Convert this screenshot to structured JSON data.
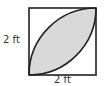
{
  "diagram": {
    "type": "geometry",
    "square": {
      "side_label_left": "2 ft",
      "side_label_bottom": "2 ft",
      "x": 29,
      "y": 8,
      "size": 67
    },
    "colors": {
      "stroke": "#222222",
      "shaded_region": "#d9d9d9",
      "background": "#ffffff",
      "label": "#333333"
    }
  }
}
